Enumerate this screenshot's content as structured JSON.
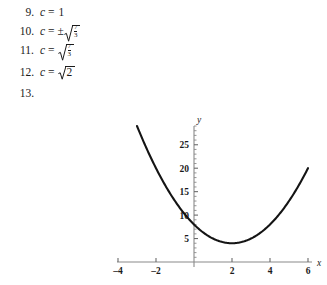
{
  "answers": {
    "items": [
      {
        "number": "9.",
        "variable": "c",
        "equals": "=",
        "sign": "",
        "type": "plain",
        "value": "1"
      },
      {
        "number": "10.",
        "variable": "c",
        "equals": "=",
        "sign": "±",
        "type": "radical-fraction",
        "numerator": "7",
        "denominator": "3"
      },
      {
        "number": "11.",
        "variable": "c",
        "equals": "=",
        "sign": "",
        "type": "radical-fraction",
        "numerator": "7",
        "denominator": "3"
      },
      {
        "number": "12.",
        "variable": "c",
        "equals": "=",
        "sign": "",
        "type": "radical-plain",
        "value": "2"
      },
      {
        "number": "13.",
        "variable": "",
        "equals": "",
        "sign": "",
        "type": "empty",
        "value": ""
      }
    ]
  },
  "chart_data": {
    "type": "line",
    "title": "",
    "xlabel": "x",
    "ylabel": "y",
    "xlim": [
      -4,
      6
    ],
    "ylim": [
      0,
      29
    ],
    "grid": false,
    "legend": null,
    "x_ticks": [
      -4,
      -2,
      2,
      4,
      6
    ],
    "x_tick_labels": [
      "–4",
      "–2",
      "2",
      "4",
      "6"
    ],
    "y_ticks": [
      5,
      10,
      15,
      20,
      25
    ],
    "y_tick_labels": [
      "5",
      "10",
      "15",
      "20",
      "25"
    ],
    "x_minor_step": 1,
    "y_minor_step": 1,
    "series": [
      {
        "name": "y = x² – 4x + 8",
        "equation_a": 1,
        "equation_b": -4,
        "equation_c": 8,
        "x_start": -3,
        "x_end": 6,
        "vertex": [
          2,
          4
        ],
        "y_intercept": 8,
        "points": [
          [
            -3,
            29
          ],
          [
            -2.5,
            24.25
          ],
          [
            -2,
            20
          ],
          [
            -1.5,
            16.25
          ],
          [
            -1,
            13
          ],
          [
            -0.5,
            10.25
          ],
          [
            0,
            8
          ],
          [
            0.5,
            6.25
          ],
          [
            1,
            5
          ],
          [
            1.5,
            4.25
          ],
          [
            2,
            4
          ],
          [
            2.5,
            4.25
          ],
          [
            3,
            5
          ],
          [
            3.5,
            6.25
          ],
          [
            4,
            8
          ],
          [
            4.5,
            10.25
          ],
          [
            5,
            13
          ],
          [
            5.5,
            16.25
          ],
          [
            6,
            20
          ]
        ]
      }
    ]
  },
  "colors": {
    "curve": "#141414",
    "axis": "#8a8a8a",
    "text": "#1a1a1a",
    "background": "#ffffff"
  }
}
